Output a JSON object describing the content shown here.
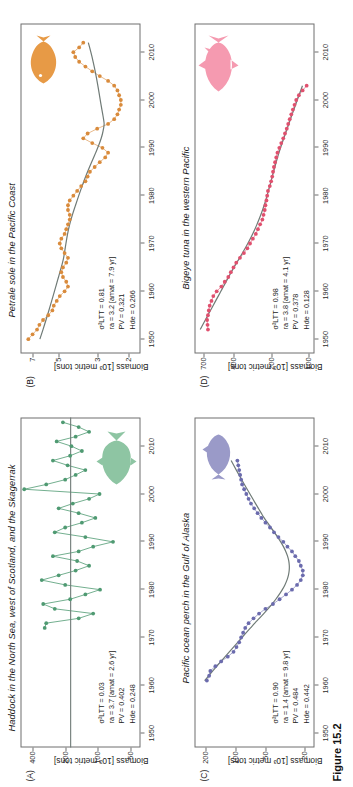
{
  "figure": {
    "caption": "Figure 15.2",
    "axis_y_label": "Biomass [10³ metric tons]"
  },
  "panels": [
    {
      "id": "A",
      "label": "(A)",
      "title": "Haddock in the North Sea, west of Scotland, and the Skagerrak",
      "accent": "#4f9a72",
      "fish": "haddock-silhouette",
      "stats": {
        "sigma_label": "σ²LTT",
        "sigma_value": "0.03",
        "ra_label": "ra",
        "ra_value": "3.7",
        "amat_label": "amat",
        "amat_value": "2.6 yr",
        "pv_label": "PV",
        "pv_value": "0.402",
        "h_label": "Hde",
        "h_value": "0.248",
        "lines": [
          "σ²LTT = 0.03",
          "ra = 3.7 [amat = 2.6 yr]",
          "PV = 0.402",
          "Hde = 0.248"
        ]
      },
      "axes": {
        "ylabel": "Biomass [10³ metric tons]",
        "yticks": [
          "400",
          "200",
          "100",
          "50"
        ],
        "ytick_values": [
          400,
          200,
          100,
          50
        ],
        "ylim": [
          40,
          520
        ],
        "log_y": true,
        "xticks": [
          "1950",
          "1960",
          "1970",
          "1980",
          "1990",
          "2000",
          "2010"
        ],
        "xlim": [
          1947,
          2016
        ],
        "grid": false
      },
      "fit_type": "flat-line"
    },
    {
      "id": "B",
      "label": "(B)",
      "title": "Petrale sole in the Pacific Coast",
      "accent": "#d98b3c",
      "fish": "sole-silhouette",
      "stats": {
        "sigma_label": "σ²LTT",
        "sigma_value": "0.81",
        "ra_label": "ra",
        "ra_value": "3.2",
        "amat_label": "amat",
        "amat_value": "7.9 yr",
        "pv_label": "PV",
        "pv_value": "0.321",
        "h_label": "Hde",
        "h_value": "0.266",
        "lines": [
          "σ²LTT = 0.81",
          "ra = 3.2 [amat = 7.9 yr]",
          "PV = 0.321",
          "Hde = 0.266"
        ]
      },
      "axes": {
        "ylabel": "Biomass [10³ metric tons]",
        "yticks": [
          "7",
          "5",
          "3",
          "2"
        ],
        "ytick_values": [
          7,
          5,
          3,
          2
        ],
        "ylim": [
          1.7,
          8.2
        ],
        "log_y": true,
        "xticks": [
          "1950",
          "1960",
          "1970",
          "1980",
          "1990",
          "2000",
          "2010"
        ],
        "xlim": [
          1947,
          2016
        ],
        "grid": false
      },
      "fit_type": "smooth-curve"
    },
    {
      "id": "C",
      "label": "(C)",
      "title": "Pacific ocean perch in the Gulf of Alaska",
      "accent": "#6b6bad",
      "fish": "perch-silhouette",
      "stats": {
        "sigma_label": "σ²LTT",
        "sigma_value": "0.90",
        "ra_label": "ra",
        "ra_value": "1.4",
        "amat_label": "amat",
        "amat_value": "9.8 yr",
        "pv_label": "PV",
        "pv_value": "0.484",
        "h_label": "Hde",
        "h_value": "0.442",
        "lines": [
          "σ²LTT = 0.90",
          "ra = 1.4 [amat = 9.8 yr]",
          "PV = 0.484",
          "Hde = 0.442"
        ]
      },
      "axes": {
        "ylabel": "Biomass [10³ metric tons]",
        "yticks": [
          "200",
          "100",
          "50",
          "20"
        ],
        "ytick_values": [
          200,
          100,
          50,
          20
        ],
        "ylim": [
          16,
          260
        ],
        "log_y": true,
        "xticks": [
          "1950",
          "1960",
          "1970",
          "1980",
          "1990",
          "2000",
          "2010"
        ],
        "xlim": [
          1947,
          2016
        ],
        "grid": false
      },
      "fit_type": "smooth-curve"
    },
    {
      "id": "D",
      "label": "(D)",
      "title": "Bigeye tuna in the western Pacific",
      "accent": "#e0506e",
      "fish": "tuna-silhouette",
      "stats": {
        "sigma_label": "σ²LTT",
        "sigma_value": "0.98",
        "ra_label": "ra",
        "ra_value": "3.8",
        "amat_label": "amat",
        "amat_value": "4.1 yr",
        "pv_label": "PV",
        "pv_value": "0.378",
        "h_label": "Hde",
        "h_value": "0.128",
        "lines": [
          "σ²LTT = 0.98",
          "ra = 3.8 [amat = 4.1 yr]",
          "PV = 0.378",
          "Hde = 0.128"
        ]
      },
      "axes": {
        "ylabel": "Biomass [10³ metric tons]",
        "yticks": [
          "700",
          "400",
          "200",
          "100"
        ],
        "ytick_values": [
          700,
          400,
          200,
          100
        ],
        "ylim": [
          90,
          820
        ],
        "log_y": true,
        "xticks": [
          "1950",
          "1960",
          "1970",
          "1980",
          "1990",
          "2000",
          "2010"
        ],
        "xlim": [
          1947,
          2016
        ],
        "grid": false
      },
      "fit_type": "smooth-curve"
    }
  ],
  "chart_data": [
    {
      "type": "line",
      "panel": "A",
      "title": "Haddock in the North Sea, west of Scotland, and the Skagerrak",
      "xlabel": "",
      "ylabel": "Biomass [10³ metric tons]",
      "xlim": [
        1947,
        2016
      ],
      "ylim": [
        40,
        520
      ],
      "log_y": true,
      "series_color": "#4f9a72",
      "x": [
        1972,
        1973,
        1974,
        1975,
        1976,
        1977,
        1978,
        1979,
        1980,
        1981,
        1982,
        1983,
        1984,
        1985,
        1986,
        1987,
        1988,
        1989,
        1990,
        1991,
        1992,
        1993,
        1994,
        1995,
        1996,
        1997,
        1998,
        1999,
        2000,
        2001,
        2002,
        2003,
        2004,
        2005,
        2006,
        2007,
        2008,
        2009,
        2010,
        2011,
        2012,
        2013,
        2014,
        2015
      ],
      "y": [
        310,
        300,
        150,
        110,
        250,
        320,
        180,
        130,
        95,
        200,
        330,
        230,
        160,
        120,
        155,
        260,
        150,
        110,
        72,
        130,
        250,
        200,
        140,
        105,
        150,
        230,
        170,
        120,
        96,
        480,
        300,
        200,
        160,
        130,
        190,
        260,
        180,
        140,
        175,
        240,
        160,
        120,
        150,
        210
      ],
      "fit_line_value": 178,
      "fit_type": "flat-line"
    },
    {
      "type": "line",
      "panel": "B",
      "title": "Petrale sole in the Pacific Coast",
      "xlabel": "",
      "ylabel": "Biomass [10³ metric tons]",
      "xlim": [
        1947,
        2016
      ],
      "ylim": [
        1.7,
        8.2
      ],
      "log_y": true,
      "series_color": "#d98b3c",
      "x": [
        1950,
        1951,
        1952,
        1953,
        1954,
        1955,
        1956,
        1957,
        1958,
        1959,
        1960,
        1961,
        1962,
        1963,
        1964,
        1965,
        1966,
        1967,
        1968,
        1969,
        1970,
        1971,
        1972,
        1973,
        1974,
        1975,
        1976,
        1977,
        1978,
        1979,
        1980,
        1981,
        1982,
        1983,
        1984,
        1985,
        1986,
        1987,
        1988,
        1989,
        1990,
        1991,
        1992,
        1993,
        1994,
        1995,
        1996,
        1997,
        1998,
        1999,
        2000,
        2001,
        2002,
        2003,
        2004,
        2005,
        2006,
        2007,
        2008,
        2009,
        2010,
        2011,
        2012
      ],
      "y": [
        7.4,
        7.0,
        6.6,
        6.4,
        6.1,
        5.7,
        5.4,
        5.3,
        5.1,
        4.9,
        4.6,
        4.4,
        4.5,
        4.7,
        4.8,
        4.7,
        4.5,
        4.4,
        4.6,
        4.8,
        4.9,
        4.8,
        4.6,
        4.5,
        4.4,
        4.3,
        4.3,
        4.4,
        4.4,
        4.3,
        4.1,
        3.9,
        3.7,
        3.5,
        3.4,
        3.3,
        3.1,
        2.9,
        2.7,
        2.6,
        2.8,
        3.2,
        3.6,
        3.4,
        3.0,
        2.6,
        2.4,
        2.3,
        2.25,
        2.2,
        2.2,
        2.25,
        2.3,
        2.4,
        2.6,
        2.9,
        3.2,
        3.5,
        3.8,
        4.0,
        4.1,
        3.8,
        3.6
      ],
      "fit_type": "smooth-curve"
    },
    {
      "type": "line",
      "panel": "C",
      "title": "Pacific ocean perch in the Gulf of Alaska",
      "xlabel": "",
      "ylabel": "Biomass [10³ metric tons]",
      "xlim": [
        1947,
        2016
      ],
      "ylim": [
        16,
        260
      ],
      "log_y": true,
      "series_color": "#6b6bad",
      "x": [
        1961,
        1962,
        1963,
        1964,
        1965,
        1966,
        1967,
        1968,
        1969,
        1970,
        1971,
        1972,
        1973,
        1974,
        1975,
        1976,
        1977,
        1978,
        1979,
        1980,
        1981,
        1982,
        1983,
        1984,
        1985,
        1986,
        1987,
        1988,
        1989,
        1990,
        1991,
        1992,
        1993,
        1994,
        1995,
        1996,
        1997,
        1998,
        1999,
        2000,
        2001,
        2002,
        2003,
        2004,
        2005,
        2006,
        2007
      ],
      "y": [
        195,
        185,
        180,
        160,
        140,
        120,
        105,
        98,
        92,
        88,
        84,
        80,
        74,
        66,
        58,
        50,
        42,
        36,
        31,
        27,
        24,
        22,
        21,
        21,
        22,
        23,
        25,
        27,
        30,
        33,
        37,
        41,
        45,
        50,
        55,
        60,
        65,
        70,
        74,
        78,
        82,
        86,
        88,
        90,
        92,
        94,
        96
      ],
      "fit_type": "smooth-curve"
    },
    {
      "type": "line",
      "panel": "D",
      "title": "Bigeye tuna in the western Pacific",
      "xlabel": "",
      "ylabel": "Biomass [10³ metric tons]",
      "xlim": [
        1947,
        2016
      ],
      "ylim": [
        90,
        820
      ],
      "log_y": true,
      "series_color": "#e0506e",
      "x": [
        1952,
        1953,
        1954,
        1955,
        1956,
        1957,
        1958,
        1959,
        1960,
        1961,
        1962,
        1963,
        1964,
        1965,
        1966,
        1967,
        1968,
        1969,
        1970,
        1971,
        1972,
        1973,
        1974,
        1975,
        1976,
        1977,
        1978,
        1979,
        1980,
        1981,
        1982,
        1983,
        1984,
        1985,
        1986,
        1987,
        1988,
        1989,
        1990,
        1991,
        1992,
        1993,
        1994,
        1995,
        1996,
        1997,
        1998,
        1999,
        2000,
        2001,
        2002,
        2003
      ],
      "y": [
        640,
        645,
        650,
        640,
        630,
        620,
        600,
        580,
        545,
        500,
        470,
        440,
        420,
        400,
        380,
        355,
        330,
        310,
        295,
        280,
        265,
        255,
        245,
        235,
        230,
        225,
        222,
        218,
        215,
        212,
        205,
        200,
        196,
        193,
        190,
        186,
        182,
        178,
        172,
        166,
        160,
        155,
        150,
        146,
        142,
        138,
        134,
        130,
        126,
        120,
        112,
        104
      ],
      "fit_type": "smooth-curve"
    }
  ]
}
